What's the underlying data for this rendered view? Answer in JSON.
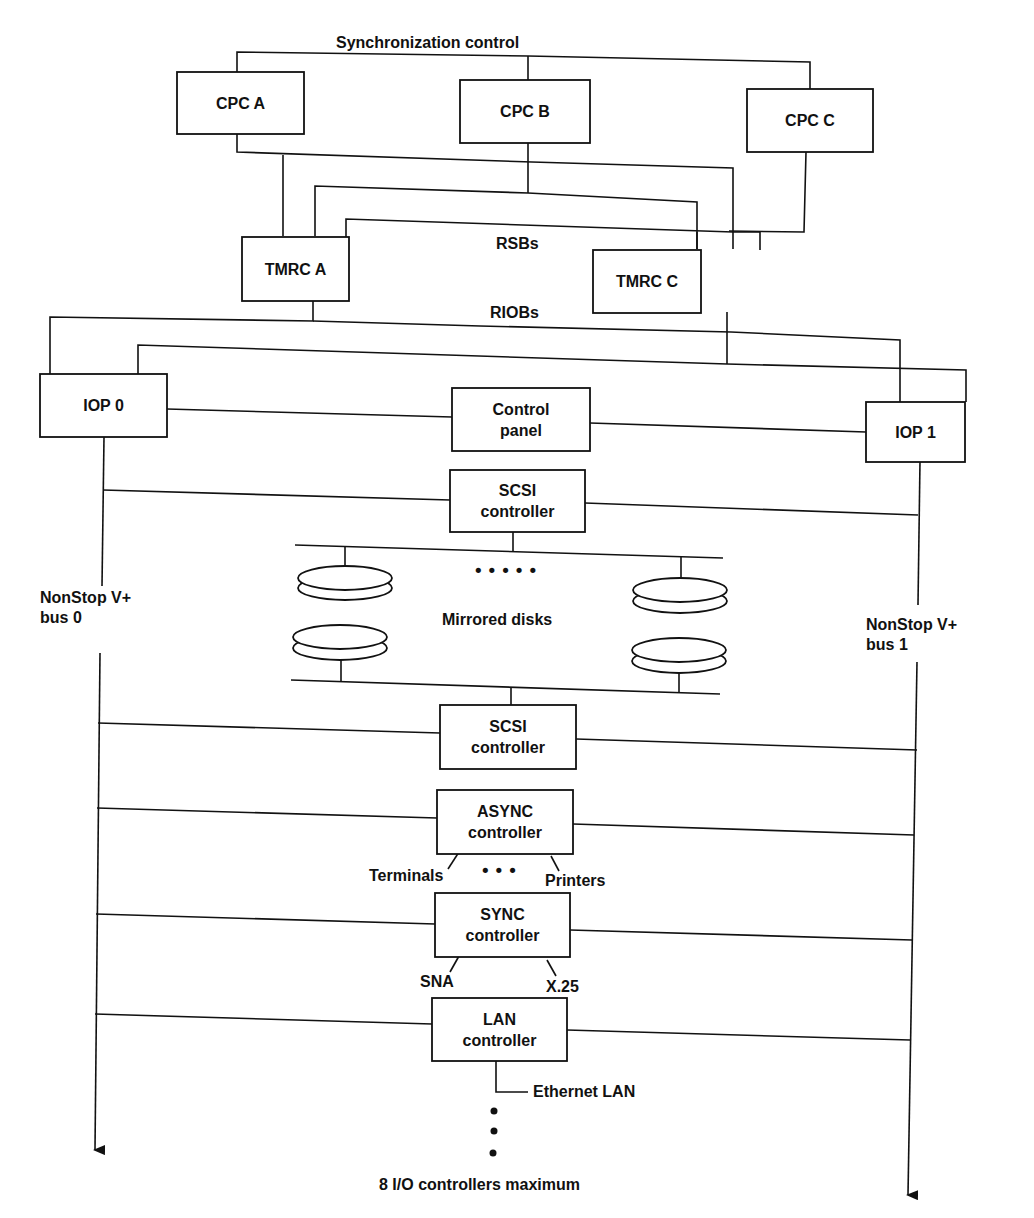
{
  "diagram": {
    "type": "system-architecture",
    "labels": {
      "sync_control": "Synchronization control",
      "rsbs": "RSBs",
      "riobs": "RIOBs",
      "bus0_line1": "NonStop V+",
      "bus0_line2": "bus 0",
      "bus1_line1": "NonStop V+",
      "bus1_line2": "bus 1",
      "mirrored_disks": "Mirrored disks",
      "terminals": "Terminals",
      "printers": "Printers",
      "sna": "SNA",
      "x25": "X.25",
      "ethernet": "Ethernet LAN",
      "max_controllers": "8 I/O controllers maximum",
      "ellipsis_h5": "•••••",
      "ellipsis_h3": "•••"
    },
    "nodes": {
      "cpc_a": {
        "line1": "CPC A"
      },
      "cpc_b": {
        "line1": "CPC B"
      },
      "cpc_c": {
        "line1": "CPC C"
      },
      "tmrc_a": {
        "line1": "TMRC A"
      },
      "tmrc_c": {
        "line1": "TMRC C"
      },
      "iop_0": {
        "line1": "IOP 0"
      },
      "iop_1": {
        "line1": "IOP 1"
      },
      "control_panel": {
        "line1": "Control",
        "line2": "panel"
      },
      "scsi_1": {
        "line1": "SCSI",
        "line2": "controller"
      },
      "scsi_2": {
        "line1": "SCSI",
        "line2": "controller"
      },
      "async": {
        "line1": "ASYNC",
        "line2": "controller"
      },
      "sync": {
        "line1": "SYNC",
        "line2": "controller"
      },
      "lan": {
        "line1": "LAN",
        "line2": "controller"
      }
    },
    "edges": [
      [
        "cpc_a",
        "sync_control"
      ],
      [
        "cpc_b",
        "sync_control"
      ],
      [
        "cpc_c",
        "sync_control"
      ],
      [
        "cpc_a",
        "tmrc_a"
      ],
      [
        "cpc_a",
        "tmrc_c"
      ],
      [
        "cpc_b",
        "tmrc_a"
      ],
      [
        "cpc_b",
        "tmrc_c"
      ],
      [
        "cpc_c",
        "tmrc_a"
      ],
      [
        "cpc_c",
        "tmrc_c"
      ],
      [
        "tmrc_a",
        "iop_0"
      ],
      [
        "tmrc_a",
        "iop_1"
      ],
      [
        "tmrc_c",
        "iop_0"
      ],
      [
        "tmrc_c",
        "iop_1"
      ],
      [
        "iop_0",
        "control_panel"
      ],
      [
        "control_panel",
        "iop_1"
      ],
      [
        "iop_0",
        "bus_0"
      ],
      [
        "iop_1",
        "bus_1"
      ],
      [
        "bus_0",
        "scsi_1"
      ],
      [
        "scsi_1",
        "bus_1"
      ],
      [
        "scsi_1",
        "mirrored_disks"
      ],
      [
        "mirrored_disks",
        "scsi_2"
      ],
      [
        "bus_0",
        "scsi_2"
      ],
      [
        "scsi_2",
        "bus_1"
      ],
      [
        "bus_0",
        "async"
      ],
      [
        "async",
        "bus_1"
      ],
      [
        "async",
        "terminals"
      ],
      [
        "async",
        "printers"
      ],
      [
        "bus_0",
        "sync"
      ],
      [
        "sync",
        "bus_1"
      ],
      [
        "sync",
        "sna"
      ],
      [
        "sync",
        "x25"
      ],
      [
        "bus_0",
        "lan"
      ],
      [
        "lan",
        "bus_1"
      ],
      [
        "lan",
        "ethernet"
      ]
    ]
  }
}
